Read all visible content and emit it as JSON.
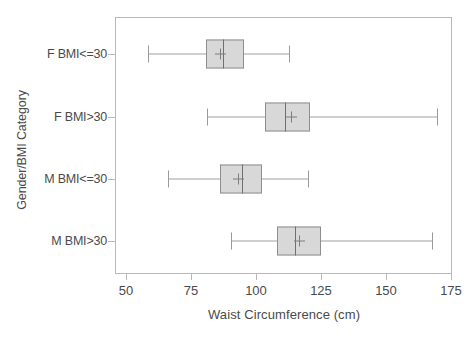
{
  "chart_data": {
    "type": "boxplot",
    "title": "",
    "xlabel": "Waist Circumference (cm)",
    "ylabel": "Gender/BMI Category",
    "xlim": [
      50,
      175
    ],
    "xticks": [
      50,
      75,
      100,
      125,
      150,
      175
    ],
    "xtick_labels": [
      "50",
      "75",
      "100",
      "125",
      "150",
      "175"
    ],
    "grid": false,
    "legend": "none",
    "orientation": "horizontal",
    "categories": [
      "F BMI<=30",
      "F BMI>30",
      "M BMI<=30",
      "M BMI>30"
    ],
    "boxes": [
      {
        "category": "F BMI<=30",
        "whisker_low": 58.5,
        "q1": 80.8,
        "median": 87.3,
        "mean": 86.2,
        "q3": 95.4,
        "whisker_high": 112.7
      },
      {
        "category": "F BMI>30",
        "whisker_low": 81.2,
        "q1": 103.5,
        "median": 111.2,
        "mean": 113.5,
        "q3": 120.8,
        "whisker_high": 169.6
      },
      {
        "category": "M BMI<=30",
        "whisker_low": 66.2,
        "q1": 86.2,
        "median": 94.6,
        "mean": 93.1,
        "q3": 102.3,
        "whisker_high": 120.0
      },
      {
        "category": "M BMI>30",
        "whisker_low": 90.4,
        "q1": 108.1,
        "median": 115.0,
        "mean": 116.5,
        "q3": 125.0,
        "whisker_high": 167.7
      }
    ],
    "colors": {
      "box_fill": "#d8d8d8",
      "box_border": "#8e8e8e",
      "median": "#6f6f6f",
      "whisker": "#a0a0a0",
      "mean_marker": "#7d7d7d",
      "axis": "#b9b9b9",
      "text": "#4a4a4a",
      "background": "#ffffff"
    }
  }
}
